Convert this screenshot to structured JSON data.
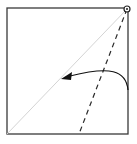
{
  "diagram": {
    "type": "origami-fold-step",
    "colors": {
      "background": "#ffffff",
      "edge": "#3a3a3a",
      "diagonal": "#d4d4d4",
      "dashed_fold": "#2a2a2a",
      "arrow": "#111111"
    },
    "square": {
      "x": 7,
      "y": 8,
      "width": 121,
      "height": 126
    },
    "pivot_point": {
      "x": 127,
      "y": 9,
      "r": 3
    },
    "diagonal_crease": {
      "x1": 127,
      "y1": 9,
      "x2": 7,
      "y2": 134
    },
    "valley_fold_line": {
      "x1": 127,
      "y1": 9,
      "x2": 79,
      "y2": 134
    },
    "fold_arrow": {
      "path": "M128 90 C 126 70, 110 66, 66 77",
      "head": {
        "x": 62,
        "y": 78
      }
    }
  }
}
